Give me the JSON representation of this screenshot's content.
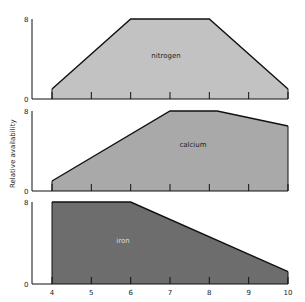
{
  "chart_data": [
    {
      "type": "area",
      "title": "nitrogen",
      "x": [
        4,
        6,
        8,
        10
      ],
      "values": [
        1,
        8,
        8,
        1
      ],
      "ylim": [
        0,
        8
      ],
      "xlim": [
        4,
        10
      ],
      "ytick_labels": [
        "0",
        "8"
      ],
      "fill_color": "#c2c2c2",
      "label_color": "#222222"
    },
    {
      "type": "area",
      "title": "calcium",
      "x": [
        4,
        7,
        8.2,
        10
      ],
      "values": [
        1,
        8,
        8,
        6.5
      ],
      "ylim": [
        0,
        8
      ],
      "xlim": [
        4,
        10
      ],
      "ytick_labels": [
        "0",
        "8"
      ],
      "fill_color": "#a9a9a9",
      "label_color": "#222222"
    },
    {
      "type": "area",
      "title": "iron",
      "x": [
        4,
        6,
        10
      ],
      "values": [
        8,
        8,
        1.2
      ],
      "ylim": [
        0,
        8
      ],
      "xlim": [
        4,
        10
      ],
      "ytick_labels": [
        "0",
        "8"
      ],
      "fill_color": "#6d6d6d",
      "label_color": "#dddddd"
    }
  ],
  "axes": {
    "ylabel": "Relative availability",
    "xticks": [
      "4",
      "5",
      "6",
      "7",
      "8",
      "9",
      "10"
    ]
  }
}
